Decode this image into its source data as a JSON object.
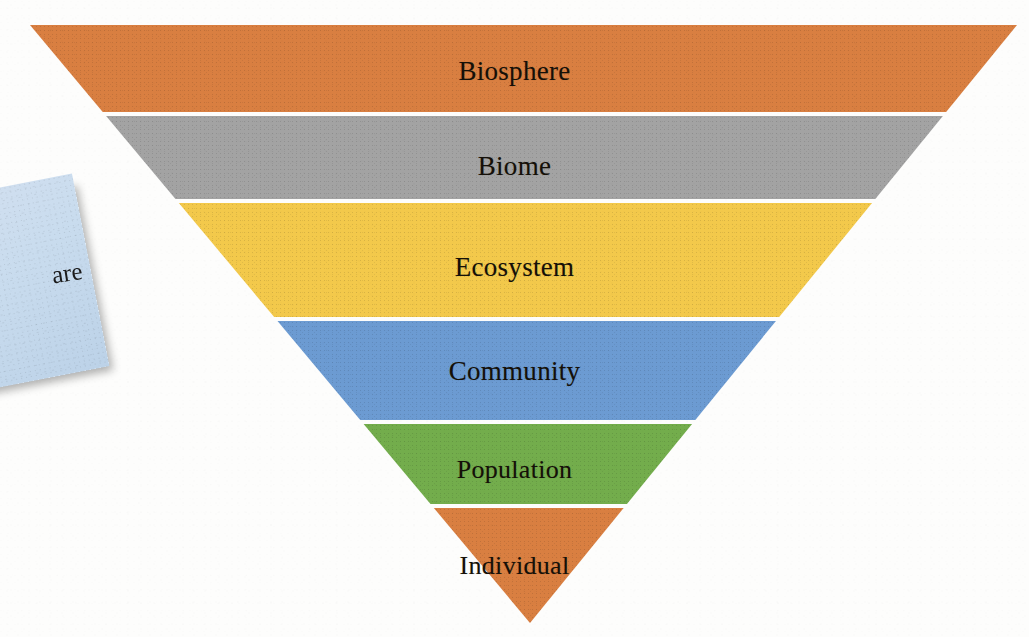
{
  "figure": {
    "kind": "inverted-pyramid-diagram",
    "background_color": "#fdfdfc",
    "text_color": "#151008",
    "separator_color": "#ffffff",
    "apex": {
      "x": 530,
      "y": 623
    },
    "top_edge": {
      "left_x": 30,
      "right_x": 1017,
      "y": 25
    }
  },
  "chart_data": {
    "type": "funnel",
    "xlabel": "",
    "ylabel": "",
    "orientation": "inverted-pyramid",
    "categories": [
      "Biosphere",
      "Biome",
      "Ecosystem",
      "Community",
      "Population",
      "Individual"
    ],
    "values": [
      100,
      82,
      70,
      50,
      32,
      18
    ],
    "colors": [
      "#D97F41",
      "#A3A3A3",
      "#F3C94B",
      "#6C9BD2",
      "#73AD4C",
      "#D97F41"
    ],
    "legend": "none",
    "grid": false
  },
  "levels": [
    {
      "label": "Biosphere",
      "color": "#D97F41",
      "color_name": "orange",
      "top": 25,
      "bottom": 112,
      "font_size": 27,
      "label_y": 58
    },
    {
      "label": "Biome",
      "color": "#A3A3A3",
      "color_name": "gray",
      "top": 116,
      "bottom": 199,
      "font_size": 27,
      "label_y": 153
    },
    {
      "label": "Ecosystem",
      "color": "#F3C94B",
      "color_name": "yellow",
      "top": 203,
      "bottom": 317,
      "font_size": 27,
      "label_y": 254
    },
    {
      "label": "Community",
      "color": "#6C9BD2",
      "color_name": "blue",
      "top": 321,
      "bottom": 420,
      "font_size": 27,
      "label_y": 358
    },
    {
      "label": "Population",
      "color": "#73AD4C",
      "color_name": "green",
      "top": 424,
      "bottom": 504,
      "font_size": 26,
      "label_y": 457
    },
    {
      "label": "Individual",
      "color": "#D97F41",
      "color_name": "orange",
      "top": 508,
      "bottom": 623,
      "font_size": 26,
      "label_y": 553
    }
  ],
  "sticky_note": {
    "visible_text": "are",
    "color": "#c9dcee",
    "color_name": "light-blue"
  }
}
